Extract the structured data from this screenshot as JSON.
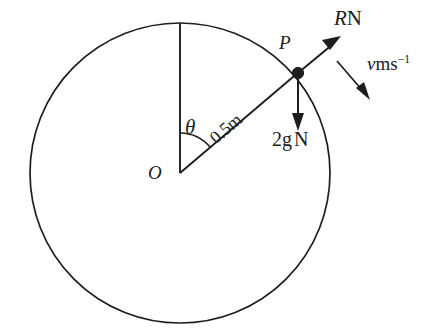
{
  "figure": {
    "type": "physics-free-body-diagram"
  },
  "labels": {
    "centre": "O",
    "point": "P",
    "angle": "θ",
    "radius": "0.5m",
    "reaction_symbol": "R",
    "reaction_unit": "N",
    "weight": "2g",
    "weight_unit": "N",
    "velocity_symbol": "v",
    "velocity_unit": "ms",
    "velocity_exponent": "−1"
  },
  "geometry": {
    "circle": {
      "cx": 180,
      "cy": 173,
      "r": 150
    },
    "point_P": {
      "x": 298,
      "y": 73
    },
    "angle_from_vertical_deg": 49.7,
    "radius_value": "0.5",
    "radius_unit": "m",
    "vertical_line": {
      "x1": 180,
      "y1": 173,
      "x2": 180,
      "y2": 23
    },
    "reaction_arrow": {
      "x1": 298,
      "y1": 73,
      "x2": 340,
      "y2": 37
    },
    "weight_arrow": {
      "x1": 298,
      "y1": 73,
      "x2": 298,
      "y2": 131
    },
    "velocity_arrow": {
      "x1": 337,
      "y1": 61,
      "x2": 369,
      "y2": 99
    },
    "angle_arc_radius": 40
  },
  "colors": {
    "stroke": "#1d1d1f",
    "background": "#ffffff"
  }
}
